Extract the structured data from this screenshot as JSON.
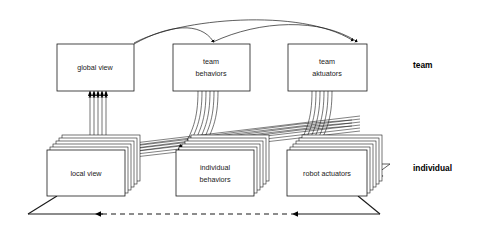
{
  "diagram": {
    "colors": {
      "stroke": "#1a1a1a",
      "box_fill": "#ffffff",
      "stack_fill": "#ffffff",
      "arrow_fill": "#000000",
      "text": "#1a1a1a"
    },
    "tier_labels": [
      {
        "id": "team",
        "text": "team",
        "x": 413,
        "y": 68
      },
      {
        "id": "individual",
        "text": "individual",
        "x": 413,
        "y": 171
      }
    ],
    "team_boxes": [
      {
        "id": "global-view",
        "lines": [
          "global view"
        ],
        "x": 57,
        "y": 44,
        "w": 77,
        "h": 47
      },
      {
        "id": "team-behaviors",
        "lines": [
          "team",
          "behaviors"
        ],
        "x": 173,
        "y": 44,
        "w": 77,
        "h": 47
      },
      {
        "id": "team-aktuators",
        "lines": [
          "team",
          "aktuators"
        ],
        "x": 288,
        "y": 44,
        "w": 79,
        "h": 47
      }
    ],
    "individual_stacks": [
      {
        "id": "local-view",
        "lines": [
          "local view"
        ],
        "x": 47,
        "y": 150,
        "w": 78,
        "h": 46,
        "copies": 6
      },
      {
        "id": "individual-behaviors",
        "lines": [
          "individual",
          "behaviors"
        ],
        "x": 176,
        "y": 150,
        "w": 78,
        "h": 46,
        "copies": 6
      },
      {
        "id": "robot-actuators",
        "lines": [
          "robot actuators"
        ],
        "x": 287,
        "y": 150,
        "w": 80,
        "h": 46,
        "copies": 6
      }
    ],
    "feedback_loop": {
      "id": "environment-feedback-loop",
      "style": "solid-with-dashed-middle",
      "points": "358,196 380,214 28,214 57,196",
      "dashed_from_x": 103,
      "dashed_to_x": 300
    }
  }
}
